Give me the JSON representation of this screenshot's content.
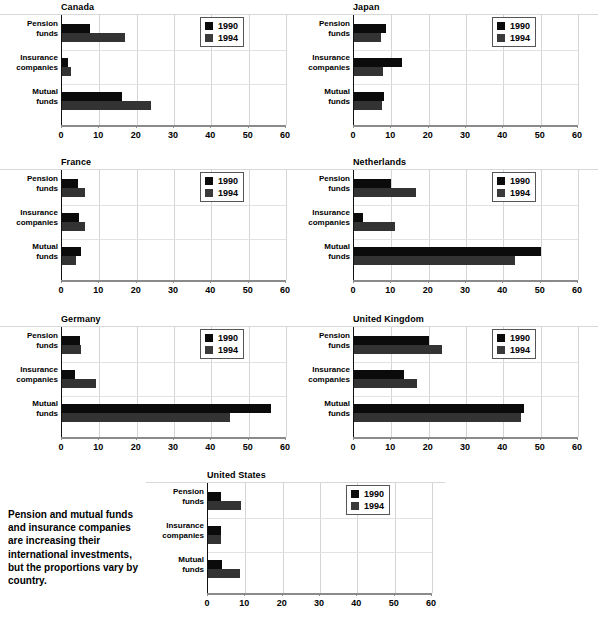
{
  "caption": "Pension and mutual funds and insurance companies are increasing their international investments, but the proportions vary by country.",
  "legend": {
    "entries": [
      {
        "label": "1990",
        "color": "#0b0b0b"
      },
      {
        "label": "1994",
        "color": "#3a3a3a"
      }
    ]
  },
  "axis": {
    "ticks": [
      "0",
      "10",
      "20",
      "30",
      "40",
      "50",
      "60"
    ],
    "min": 0,
    "max": 60
  },
  "categories": [
    {
      "line1": "Pension",
      "line2": "funds"
    },
    {
      "line1": "Insurance",
      "line2": "companies"
    },
    {
      "line1": "Mutual",
      "line2": "funds"
    }
  ],
  "chart_data": {
    "type": "bar",
    "orientation": "horizontal",
    "xlabel": "",
    "ylabel": "",
    "xlim": [
      0,
      60
    ],
    "grid": true,
    "legend_position": "top-right inside plot",
    "categories": [
      "Pension funds",
      "Insurance companies",
      "Mutual funds"
    ],
    "series_names": [
      "1990",
      "1994"
    ],
    "panels": [
      {
        "name": "Canada",
        "series": [
          {
            "name": "1990",
            "values": [
              7.5,
              1.5,
              16.0
            ]
          },
          {
            "name": "1994",
            "values": [
              16.8,
              2.4,
              23.8
            ]
          }
        ]
      },
      {
        "name": "Japan",
        "series": [
          {
            "name": "1990",
            "values": [
              8.6,
              12.8,
              8.0
            ]
          },
          {
            "name": "1994",
            "values": [
              7.2,
              7.9,
              7.6
            ]
          }
        ]
      },
      {
        "name": "France",
        "series": [
          {
            "name": "1990",
            "values": [
              4.3,
              4.5,
              5.0
            ]
          },
          {
            "name": "1994",
            "values": [
              6.2,
              6.2,
              3.8
            ]
          }
        ]
      },
      {
        "name": "Netherlands",
        "series": [
          {
            "name": "1990",
            "values": [
              9.8,
              2.3,
              50.0
            ]
          },
          {
            "name": "1994",
            "values": [
              16.5,
              11.0,
              43.0
            ]
          }
        ]
      },
      {
        "name": "Germany",
        "series": [
          {
            "name": "1990",
            "values": [
              4.8,
              3.5,
              56.0
            ]
          },
          {
            "name": "1994",
            "values": [
              5.2,
              9.0,
              45.0
            ]
          }
        ]
      },
      {
        "name": "United Kingdom",
        "series": [
          {
            "name": "1990",
            "values": [
              20.0,
              13.5,
              45.5
            ]
          },
          {
            "name": "1994",
            "values": [
              23.5,
              17.0,
              44.8
            ]
          }
        ]
      },
      {
        "name": "United States",
        "series": [
          {
            "name": "1990",
            "values": [
              3.6,
              3.5,
              3.8
            ]
          },
          {
            "name": "1994",
            "values": [
              8.8,
              3.5,
              8.7
            ]
          }
        ]
      }
    ]
  }
}
